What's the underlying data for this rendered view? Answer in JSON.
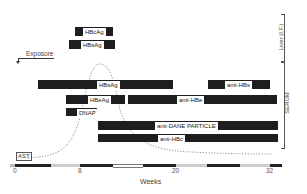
{
  "diagram": {
    "type": "serologic timeline",
    "x_axis": {
      "label": "Weeks",
      "ticks": [
        "0",
        "8",
        "20",
        "32"
      ]
    },
    "side_labels": {
      "liver": "Liver (I.F.)",
      "serum": "SERUM"
    },
    "exposure_label": "Exposure",
    "ast_label": "AST",
    "liver_markers": [
      {
        "label": "HBcAg"
      },
      {
        "label": "HBsAg"
      }
    ],
    "serum_markers": [
      {
        "label": "HBsAg"
      },
      {
        "label": "anti-HBs"
      },
      {
        "label": "HBeAg"
      },
      {
        "label": "anti-HBe"
      },
      {
        "label": "DNAP"
      },
      {
        "label": "anti-DANE PARTICLE"
      },
      {
        "label": "anti-HBc"
      }
    ]
  }
}
